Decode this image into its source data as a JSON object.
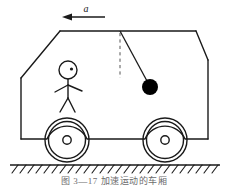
{
  "figure": {
    "caption": "图 3—17   加速运动的车厢",
    "stroke_color": "#1a1a1a",
    "bob_color": "#000000",
    "dash_color": "#555555",
    "background_color": "#ffffff",
    "acceleration_label": "a",
    "acceleration_direction": "left"
  },
  "labels": {
    "acceleration": "a"
  },
  "elements": {
    "arrow": {
      "name": "acceleration-arrow",
      "from_x": 105,
      "to_x": 63,
      "y": 17
    },
    "pendulum": {
      "pivot_x": 120,
      "pivot_y": 31,
      "bob_x": 150,
      "bob_y": 87,
      "bob_radius": 8,
      "vertical_reference_length": 47
    },
    "wheels": [
      {
        "name": "rear-wheel",
        "cx": 67,
        "cy": 140,
        "r_outer": 22,
        "r_inner": 19,
        "r_hub": 4
      },
      {
        "name": "front-wheel",
        "cx": 165,
        "cy": 140,
        "r_outer": 22,
        "r_inner": 19,
        "r_hub": 4
      }
    ],
    "ground": {
      "y": 165,
      "x_start": 10,
      "x_end": 220,
      "hatch_count": 26
    },
    "passenger": {
      "head_cx": 68,
      "head_cy": 70,
      "head_r": 9,
      "eye_cx": 71,
      "eye_cy": 69
    }
  }
}
